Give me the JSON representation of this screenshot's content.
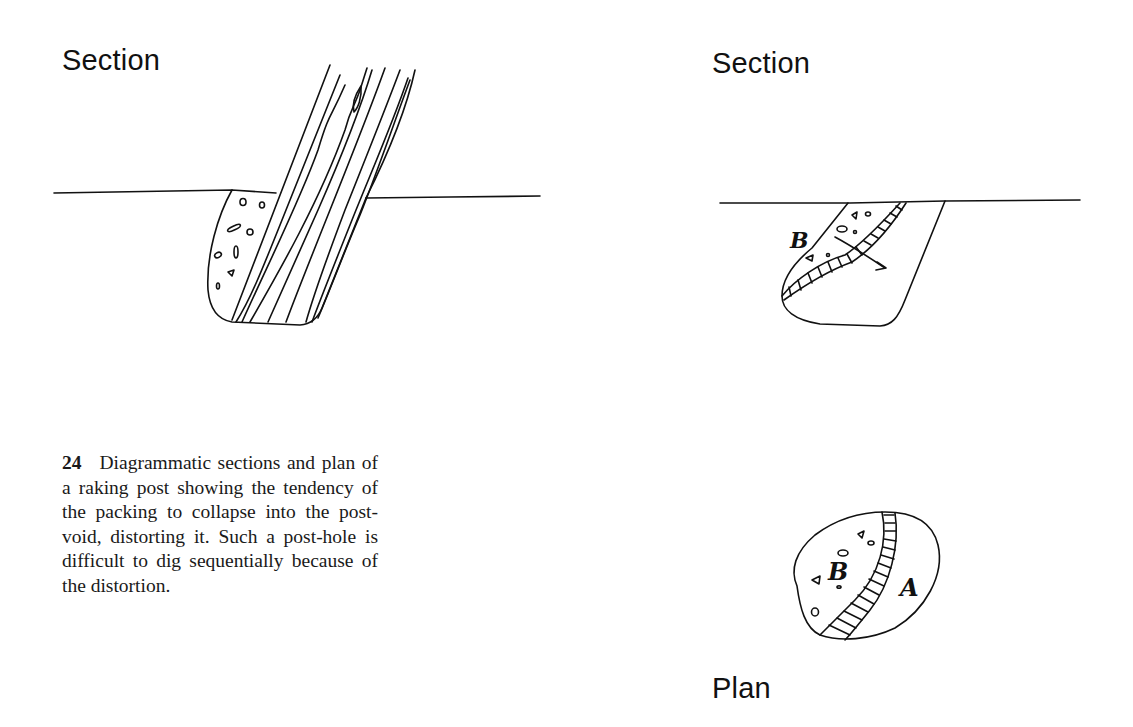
{
  "figure": {
    "number": "24",
    "caption": "Diagrammatic sections and plan of a raking post showing the tendency of the packing to collapse into the post-void, distorting it. Such a post-hole is difficult to dig sequentially because of the distortion.",
    "panels": [
      {
        "id": "section-left",
        "label": "Section",
        "description": "raking timber post set in a post-hole with stone packing on the left side"
      },
      {
        "id": "section-right",
        "label": "Section",
        "description": "post-void distorted as packing B collapses into it (arrow)",
        "markers": [
          "B"
        ]
      },
      {
        "id": "plan",
        "label": "Plan",
        "description": "plan of post-hole showing packing B and void fill A separated by hatched band",
        "markers": [
          "B",
          "A"
        ]
      }
    ]
  }
}
